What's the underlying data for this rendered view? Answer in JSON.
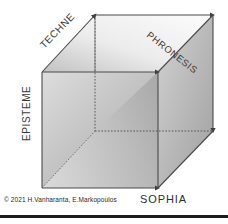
{
  "figure": {
    "background_color": "#ffffff",
    "width": 228,
    "height": 224
  },
  "labels": {
    "techne": "TECHNE",
    "phronesis": "PHRONESIS",
    "episteme": "EPISTEME",
    "sophia": "SOPHIA"
  },
  "watermark": {
    "text": "Lesson"
  },
  "credit": {
    "text": "© 2021 H.Vanharanta,  E.Markopoulos"
  },
  "colors": {
    "edge": "#4a4a4a",
    "front_face_light": "#d8d8d8",
    "front_face_dark": "#9a9a9a",
    "right_face_light": "#cfcfcf",
    "right_face_dark": "#a6a6a6",
    "top_face_light": "#fbfbfb",
    "top_face_dark": "#c2c2c2",
    "left_face_light": "#efefef",
    "left_face_dark": "#8e8e8e",
    "rule": "#1d1d1d",
    "text": "#3b3b3b"
  },
  "geometry": {
    "front": {
      "left": 42,
      "right": 158,
      "top": 72,
      "bottom": 188
    },
    "back": {
      "left": 95,
      "right": 213,
      "top": 15,
      "bottom": 131
    },
    "arrow_vertices": [
      {
        "name": "back-top-left",
        "x": 95,
        "y": 15
      },
      {
        "name": "back-top-right",
        "x": 213,
        "y": 15
      },
      {
        "name": "front-top-right",
        "x": 158,
        "y": 72
      },
      {
        "name": "back-bottom-right",
        "x": 213,
        "y": 131
      },
      {
        "name": "front-bottom-right",
        "x": 158,
        "y": 188
      }
    ]
  }
}
